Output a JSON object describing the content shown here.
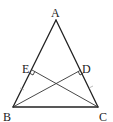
{
  "diagram": {
    "type": "geometry-triangle",
    "points": {
      "A": {
        "label": "A",
        "x": 56,
        "y": 20
      },
      "B": {
        "label": "B",
        "x": 13,
        "y": 107
      },
      "C": {
        "label": "C",
        "x": 98,
        "y": 107
      },
      "D": {
        "label": "D",
        "x": 81,
        "y": 70
      },
      "E": {
        "label": "E",
        "x": 32,
        "y": 70
      }
    },
    "segments": [
      "AB",
      "AC",
      "BC",
      "BD",
      "CE"
    ],
    "right_angles": [
      "E",
      "D"
    ],
    "equal_marks": [
      "BE",
      "CD"
    ]
  }
}
